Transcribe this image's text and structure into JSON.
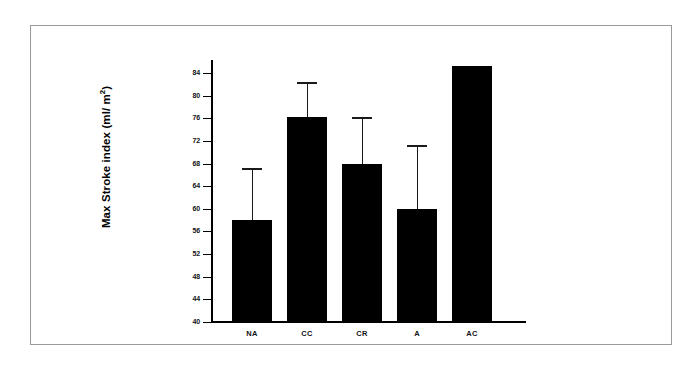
{
  "chart_data": {
    "type": "bar",
    "title": "",
    "subtitle": "",
    "xlabel": "",
    "ylabel": "Max Stroke index (ml/ m",
    "ylabel_superscript": "2",
    "ylabel_suffix": ")",
    "categories": [
      "NA",
      "CC",
      "CR",
      "A",
      "AC"
    ],
    "values": [
      58,
      76.3,
      68,
      60,
      85.3
    ],
    "error_upper": [
      67.3,
      82.4,
      76.3,
      71.2,
      null
    ],
    "series": [
      {
        "name": "Max Stroke index",
        "values": [
          58,
          76.3,
          68,
          60,
          85.3
        ]
      }
    ],
    "ylim": [
      40,
      86
    ],
    "yticks": [
      40,
      44,
      48,
      52,
      56,
      60,
      64,
      68,
      72,
      76,
      80,
      84
    ],
    "ytick_labels": [
      "40",
      "44",
      "48",
      "52",
      "56",
      "60",
      "64",
      "68",
      "72",
      "76",
      "80",
      "84"
    ],
    "grid": false,
    "legend": false,
    "legend_position": "none",
    "bar_color": "#000000",
    "axis_color": "#000000",
    "background_color": "#ffffff",
    "frame_color": "#9a9a9a",
    "errorbar_style": "upper-only-cap"
  }
}
